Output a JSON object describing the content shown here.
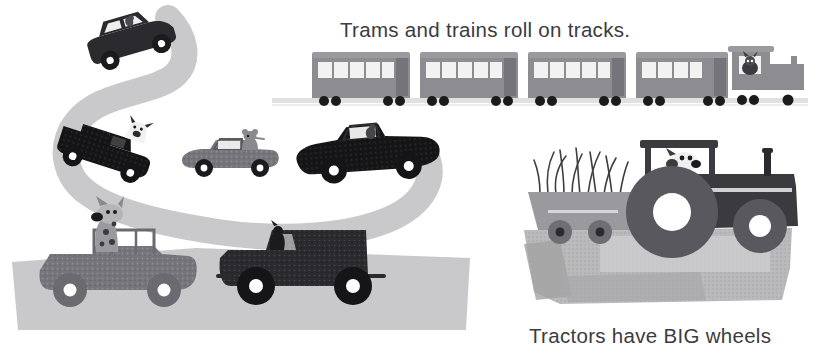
{
  "page": {
    "width": 828,
    "height": 354,
    "background": "#ffffff",
    "kind": "children-picture-book-illustration-page",
    "theme": "vehicles-and-wheels"
  },
  "captions": {
    "trams": {
      "text": "Trams and trains roll on tracks.",
      "color": "#3b3b41",
      "x": 340,
      "y": 18,
      "font_size_px": 20.5
    },
    "tractors": {
      "text": "Tractors have BIG wheels",
      "color": "#3b3b41",
      "x": 529,
      "y": 324,
      "font_size_px": 20.5
    }
  },
  "palette": {
    "white": "#ffffff",
    "text_dark": "#3b3b41",
    "black_vehicle": "#151517",
    "dark_charcoal": "#2b2b2f",
    "mid_gray": "#6e6e74",
    "gray_vehicle": "#75757b",
    "road_gray": "#c9c9cb",
    "light_gray": "#d9d9da",
    "pale_gray": "#e3e3e4",
    "track_gray": "#e0e0e1",
    "tram_body": "#8c8c91",
    "tram_body_dark": "#74747a",
    "tram_window": "#f2f2f2",
    "wheel_black": "#1b1b1d",
    "ground_gray": "#b9b9bb",
    "ground_dark": "#9a9a9c",
    "animal_gray": "#8a8a8e",
    "animal_light": "#cfcfd1"
  },
  "scenes": [
    {
      "id": "road-scene",
      "name": "winding-road-with-cars",
      "description": "A light gray S-curved road band running from upper-left down to lower-left, with five vehicles driven by animals.",
      "road_color": "#c9c9cb",
      "vehicles": [
        {
          "id": "car-top",
          "name": "dark-sedan-car",
          "body_color": "#2b2b2f",
          "driver": "animal-passenger",
          "x": 78,
          "y": 28,
          "w": 92,
          "h": 52,
          "wheels": 2
        },
        {
          "id": "pickup-truck",
          "name": "black-pickup-truck",
          "body_color": "#151517",
          "driver": "cow-or-deer",
          "x": 66,
          "y": 110,
          "w": 100,
          "h": 58,
          "wheels": 2
        },
        {
          "id": "gray-convertible",
          "name": "gray-convertible-car",
          "body_color": "#6e6e74",
          "driver": "mouse-or-rabbit",
          "x": 180,
          "y": 128,
          "w": 100,
          "h": 48,
          "wheels": 2
        },
        {
          "id": "black-convertible",
          "name": "black-vintage-convertible",
          "body_color": "#151517",
          "driver": "small-animal",
          "x": 292,
          "y": 126,
          "w": 148,
          "h": 58,
          "wheels": 2
        },
        {
          "id": "jeep",
          "name": "gray-jeep",
          "body_color": "#75757b",
          "driver": "spotted-dog",
          "x": 36,
          "y": 230,
          "w": 165,
          "h": 90,
          "wheels": 2
        },
        {
          "id": "van-truck",
          "name": "dark-delivery-van",
          "body_color": "#2b2b2f",
          "driver": "animal-driver",
          "x": 218,
          "y": 222,
          "w": 185,
          "h": 88,
          "wheels": 2
        }
      ]
    },
    {
      "id": "train-scene",
      "name": "tram-and-train-on-tracks",
      "description": "A horizontal train consisting of four tram carriages pulled by a small locomotive, running on a faint gray track line.",
      "track_color": "#e0e0e1",
      "track_y": 100,
      "carriage_count": 4,
      "windows_per_carriage": 5,
      "carriage_color": "#8c8c91",
      "window_color": "#f2f2f2",
      "locomotive": {
        "name": "locomotive",
        "driver": "animal-engineer",
        "color": "#8c8c91"
      }
    },
    {
      "id": "tractor-scene",
      "name": "tractor-pulling-grass-trailer",
      "description": "A dark tractor with a very large rear wheel driven by a dog, towing a gray trailer filled with tall grass, standing on a textured gray ground patch.",
      "ground_color": "#b9b9bb",
      "tractor": {
        "name": "tractor",
        "body_color": "#3a3a3f",
        "driver": "dog",
        "big_wheel_label": "BIG",
        "rear_wheel_radius": 46,
        "front_wheel_radius": 27,
        "has_exhaust_stack": true
      },
      "trailer": {
        "name": "grass-trailer",
        "body_color": "#9a9a9e",
        "cargo": "grass",
        "wheels": 2
      }
    }
  ]
}
